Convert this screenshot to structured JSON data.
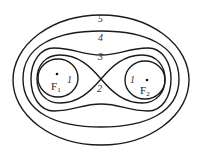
{
  "diagram": {
    "type": "cassini-ovals",
    "curve_labels": {
      "outer": "5",
      "oval4": "4",
      "peanut": "3",
      "lemniscate": "2",
      "inner_left": "1",
      "inner_right": "1"
    },
    "foci": [
      {
        "name": "F",
        "sub": "1"
      },
      {
        "name": "F",
        "sub": "2"
      }
    ],
    "stroke_color": "#1a1a1a"
  }
}
